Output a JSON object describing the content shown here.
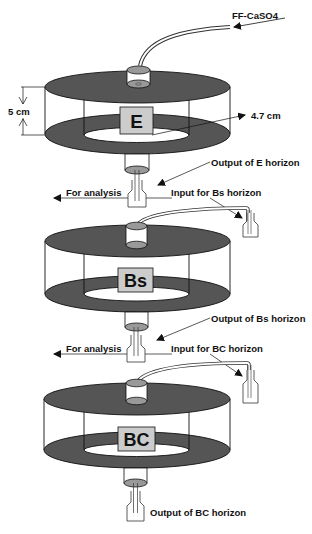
{
  "colors": {
    "disk": "#555555",
    "box_fill": "#cccccc",
    "stroke": "#111111",
    "tube_fill": "#9a9a9a"
  },
  "input_label": "FF-CaSO4",
  "dimensions": {
    "height_label": "5 cm",
    "radius_label": "4.7 cm"
  },
  "columns": [
    {
      "horizon": "E",
      "output_label": "Output of E horizon"
    },
    {
      "horizon": "Bs",
      "output_label": "Output of Bs horizon"
    },
    {
      "horizon": "BC",
      "output_label": "Output of BC horizon"
    }
  ],
  "transfers": [
    {
      "analysis_label": "For analysis",
      "input_label": "Input for Bs horizon"
    },
    {
      "analysis_label": "For analysis",
      "input_label": "Input for BC horizon"
    }
  ]
}
